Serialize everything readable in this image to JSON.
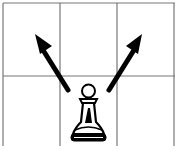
{
  "diagram": {
    "grid": {
      "columns": 3,
      "rows": 2,
      "line_color": "#777777"
    },
    "piece": {
      "name": "pawn",
      "color": "white",
      "glyph": "♙",
      "column": 2,
      "row": 2
    },
    "arrows": [
      {
        "direction": "up-left",
        "from_column": 2,
        "to_column": 1
      },
      {
        "direction": "up-right",
        "from_column": 2,
        "to_column": 3
      }
    ],
    "arrow_color": "#000000"
  }
}
